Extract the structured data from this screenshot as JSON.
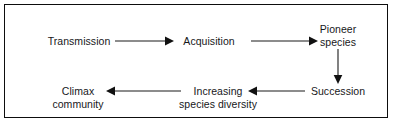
{
  "diagram": {
    "border_color": "#0d0d0d",
    "background_color": "#ffffff",
    "text_color": "#17171a",
    "arrow_color": "#1a1a1a",
    "nodes": [
      {
        "id": "transmission",
        "line1": "Transmission",
        "line2": ""
      },
      {
        "id": "acquisition",
        "line1": "Acquisition",
        "line2": ""
      },
      {
        "id": "pioneer",
        "line1": "Pioneer",
        "line2": "species"
      },
      {
        "id": "succession",
        "line1": "Succession",
        "line2": ""
      },
      {
        "id": "increasing",
        "line1": "Increasing",
        "line2": "species diversity"
      },
      {
        "id": "climax",
        "line1": "Climax",
        "line2": "community"
      }
    ],
    "arrows": [
      {
        "id": "transmission-to-acquisition",
        "direction": "right"
      },
      {
        "id": "acquisition-to-pioneer",
        "direction": "right"
      },
      {
        "id": "pioneer-to-succession",
        "direction": "down"
      },
      {
        "id": "succession-to-increasing",
        "direction": "left"
      },
      {
        "id": "increasing-to-climax",
        "direction": "left"
      }
    ]
  }
}
